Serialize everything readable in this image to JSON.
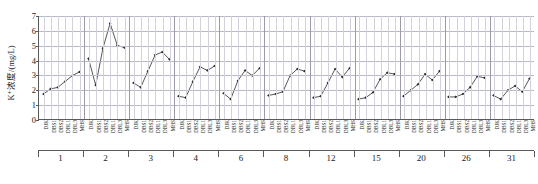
{
  "chart_data": {
    "type": "line",
    "title": "",
    "xlabel": "",
    "ylabel": "K⁺浓度/(mg/L)",
    "ylim": [
      0,
      7
    ],
    "yticks": [
      0,
      1,
      2,
      3,
      4,
      5,
      6,
      7
    ],
    "grid": true,
    "legend": "none",
    "marker": "filled-diamond",
    "line_color": "#2b2b2b",
    "grid_color": "#b9b9c8",
    "axis_color": "#5a5a5a",
    "sites": [
      "DJK",
      "DBS1",
      "DBS2",
      "DBL1",
      "DBL3",
      "MHS"
    ],
    "group_axis_name": "",
    "groups": [
      {
        "label": "1",
        "values": [
          1.7,
          2.05,
          2.15,
          2.55,
          2.95,
          3.2
        ]
      },
      {
        "label": "2",
        "values": [
          4.1,
          2.3,
          4.8,
          6.5,
          5.0,
          4.85
        ]
      },
      {
        "label": "3",
        "values": [
          2.45,
          2.15,
          3.25,
          4.35,
          4.55,
          4.05
        ]
      },
      {
        "label": "4",
        "values": [
          1.55,
          1.45,
          2.55,
          3.55,
          3.3,
          3.6
        ]
      },
      {
        "label": "6",
        "values": [
          1.75,
          1.35,
          2.6,
          3.3,
          2.95,
          3.45
        ]
      },
      {
        "label": "8",
        "values": [
          1.6,
          1.7,
          1.85,
          2.95,
          3.4,
          3.25
        ]
      },
      {
        "label": "12",
        "values": [
          1.45,
          1.55,
          2.45,
          3.4,
          2.85,
          3.45
        ]
      },
      {
        "label": "15",
        "values": [
          1.35,
          1.45,
          1.8,
          2.7,
          3.15,
          3.05
        ]
      },
      {
        "label": "20",
        "values": [
          1.55,
          1.95,
          2.35,
          3.05,
          2.65,
          3.25
        ]
      },
      {
        "label": "26",
        "values": [
          1.5,
          1.5,
          1.7,
          2.15,
          2.9,
          2.8
        ]
      },
      {
        "label": "31",
        "values": [
          1.6,
          1.35,
          1.95,
          2.25,
          1.85,
          2.75
        ]
      }
    ]
  }
}
